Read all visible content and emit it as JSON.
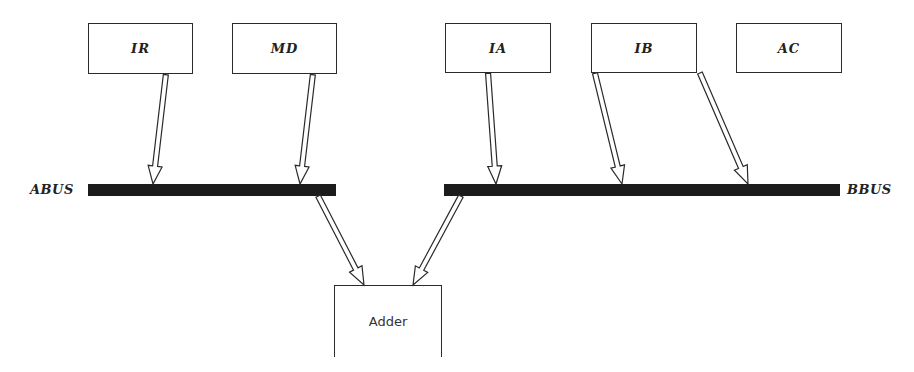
{
  "diagram": {
    "registers": [
      {
        "id": "ir",
        "label": "IR",
        "bus": "ABUS"
      },
      {
        "id": "md",
        "label": "MD",
        "bus": "ABUS"
      },
      {
        "id": "ia",
        "label": "IA",
        "bus": "BBUS"
      },
      {
        "id": "ib",
        "label": "IB",
        "bus": "BBUS"
      },
      {
        "id": "ac",
        "label": "AC",
        "bus": "BBUS"
      }
    ],
    "buses": {
      "a": {
        "label": "ABUS"
      },
      "b": {
        "label": "BBUS"
      }
    },
    "adder": {
      "label": "Adder"
    },
    "colors": {
      "line": "#2a2a2a",
      "bus": "#1c1c1c",
      "background": "#ffffff"
    }
  }
}
